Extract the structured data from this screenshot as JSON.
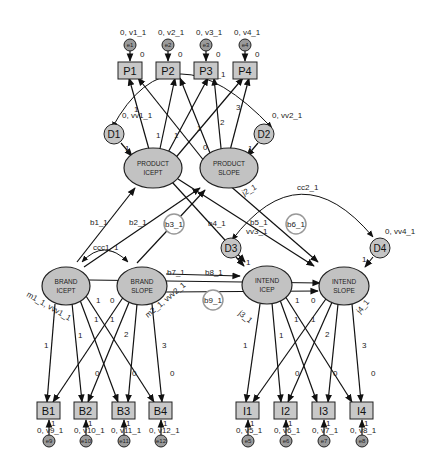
{
  "diagram": {
    "type": "structural-equation-model",
    "latents": {
      "product_icept": {
        "line1": "PRODUCT",
        "line2": "ICEPT"
      },
      "product_slope": {
        "line1": "PRODUCT",
        "line2": "SLOPE"
      },
      "brand_icept": {
        "line1": "BRAND",
        "line2": "ICEPT"
      },
      "brand_slope": {
        "line1": "BRAND",
        "line2": "SLOPE"
      },
      "intend_icept": {
        "line1": "INTEND",
        "line2": "ICEP"
      },
      "intend_slope": {
        "line1": "INTEND",
        "line2": "SLOPE"
      }
    },
    "observed": {
      "P": [
        "P1",
        "P2",
        "P3",
        "P4"
      ],
      "B": [
        "B1",
        "B2",
        "B3",
        "B4"
      ],
      "I": [
        "I1",
        "I2",
        "I3",
        "I4"
      ]
    },
    "errors": {
      "P": [
        "e1",
        "e2",
        "e3",
        "e4"
      ],
      "B": [
        "e9",
        "e10",
        "e11",
        "e12"
      ],
      "I": [
        "e5",
        "e6",
        "e7",
        "e8"
      ]
    },
    "error_labels": {
      "P": [
        "0, v1_1",
        "0, v2_1",
        "0, v3_1",
        "0, v4_1"
      ],
      "B": [
        "0, v9_1",
        "0, v10_1",
        "0, v11_1",
        "0, v12_1"
      ],
      "I": [
        "0, v5_1",
        "0, v6_1",
        "0, v7_1",
        "0, v8_1"
      ]
    },
    "disturbances": {
      "D1": {
        "name": "D1",
        "label": "0, vv1_1"
      },
      "D2": {
        "name": "D2",
        "label": "0, vv2_1"
      },
      "D3": {
        "name": "D3",
        "label": "vv3_1"
      },
      "D4": {
        "name": "D4",
        "label": "0, vv4_1"
      }
    },
    "paths": {
      "b1": "b1_1",
      "b2": "b2_1",
      "b3": "b3_1",
      "b4": "b4_1",
      "b5": "b5_1",
      "b6": "b6_1",
      "b7": "b7_1",
      "b8": "b8_1",
      "b9": "b9_1"
    },
    "covariances": {
      "c1": "c1_1",
      "cc1": "ccc1_1",
      "cc2": "cc2_1"
    },
    "means": {
      "brand_icept": "m1_1, vvv1_1",
      "brand_slope": "m2_1, vvv2_1",
      "product_slope": "j2_1",
      "intend_icept": "j3_1",
      "intend_slope": "j4_1"
    },
    "loadings": {
      "icept": [
        "1",
        "1",
        "1",
        "1"
      ],
      "slope": [
        "0",
        "1",
        "2",
        "3"
      ],
      "error_weight": "1",
      "intercept": "0"
    }
  }
}
